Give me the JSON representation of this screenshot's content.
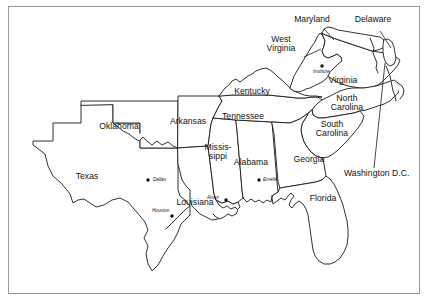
{
  "figure": {
    "kind": "line-art-map",
    "region_title": "Southeastern and South Central United States",
    "background_color": "#ffffff",
    "line_color": "#1a1a1a",
    "frame_color": "#9a9a9a"
  },
  "states": [
    {
      "id": "texas",
      "label": "Texas",
      "x": 86,
      "y": 177
    },
    {
      "id": "oklahoma",
      "label": "Oklahoma",
      "x": 118,
      "y": 127
    },
    {
      "id": "arkansas",
      "label": "Arkansas",
      "x": 188,
      "y": 122
    },
    {
      "id": "louisiana",
      "label": "Louisiana",
      "x": 194,
      "y": 203
    },
    {
      "id": "mississippi",
      "label": "Missis-\nsippi",
      "x": 218,
      "y": 153
    },
    {
      "id": "alabama",
      "label": "Alabama",
      "x": 251,
      "y": 163
    },
    {
      "id": "tennessee",
      "label": "Tennessee",
      "x": 243,
      "y": 117
    },
    {
      "id": "kentucky",
      "label": "Kentucky",
      "x": 252,
      "y": 92
    },
    {
      "id": "west-virginia",
      "label": "West\nVirginia",
      "x": 281,
      "y": 44
    },
    {
      "id": "virginia",
      "label": "Virginia",
      "x": 343,
      "y": 81
    },
    {
      "id": "maryland",
      "label": "Maryland",
      "x": 312,
      "y": 20
    },
    {
      "id": "delaware",
      "label": "Delaware",
      "x": 373,
      "y": 20
    },
    {
      "id": "north-carolina",
      "label": "North\nCarolina",
      "x": 347,
      "y": 103
    },
    {
      "id": "south-carolina",
      "label": "South\nCarolina",
      "x": 332,
      "y": 129
    },
    {
      "id": "georgia",
      "label": "Georgia",
      "x": 309,
      "y": 160
    },
    {
      "id": "florida",
      "label": "Florida",
      "x": 322,
      "y": 199
    },
    {
      "id": "washington-dc",
      "label": "Washington D.C.",
      "x": 347,
      "y": 174
    }
  ],
  "cities": [
    {
      "id": "dallas",
      "label": "Dallas",
      "dot_x": 148,
      "dot_y": 180,
      "label_x": 153,
      "label_y": 177
    },
    {
      "id": "houston",
      "label": "Houston",
      "dot_x": 172,
      "dot_y": 216,
      "label_x": 152,
      "label_y": 208
    },
    {
      "id": "alsen",
      "label": "Alsen",
      "dot_x": 226,
      "dot_y": 200,
      "label_x": 209,
      "label_y": 196
    },
    {
      "id": "emelle",
      "label": "Emelle",
      "dot_x": 259,
      "dot_y": 180,
      "label_x": 263,
      "label_y": 177
    },
    {
      "id": "institute",
      "label": "Institute",
      "dot_x": 322,
      "dot_y": 66,
      "label_x": 314,
      "label_y": 70
    }
  ]
}
